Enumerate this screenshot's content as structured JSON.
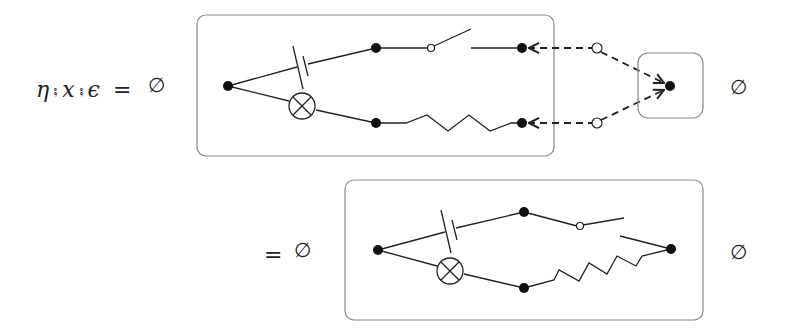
{
  "equation": {
    "lhs_terms": [
      "η",
      "x",
      "ϵ"
    ],
    "compose_symbol": "⨟",
    "equals": "=",
    "empty_set": "∅"
  },
  "row1": {
    "prefix_empty": "∅",
    "suffix_empty": "∅",
    "main_box": {
      "components": [
        "capacitor",
        "lamp",
        "switch",
        "resistor"
      ]
    },
    "cap_box": {
      "components": [
        "node"
      ]
    }
  },
  "row2": {
    "equals": "=",
    "prefix_empty": "∅",
    "suffix_empty": "∅",
    "main_box": {
      "components": [
        "capacitor",
        "lamp",
        "switch",
        "resistor"
      ]
    }
  },
  "colors": {
    "stroke": "#222222",
    "box_border": "#888888"
  }
}
